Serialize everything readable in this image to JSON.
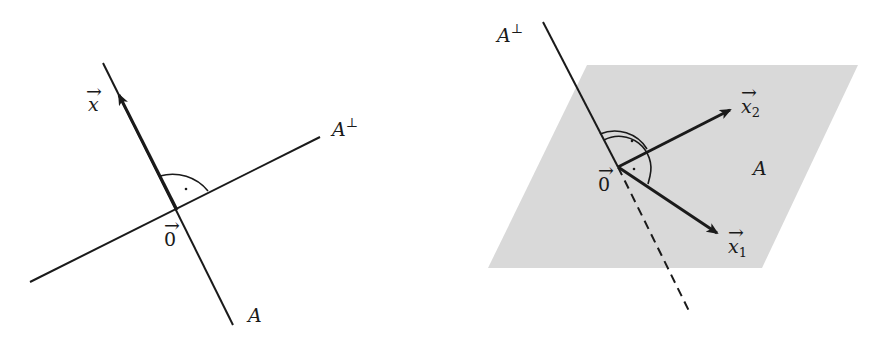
{
  "left_diagram": {
    "labels": {
      "vector_x": "x",
      "a_perp": "A",
      "a_perp_sup": "⊥",
      "a": "A",
      "origin": "0"
    },
    "description": "Line A and its orthogonal complement A-perp (a line) meeting at origin with right angle; vector x along A"
  },
  "right_diagram": {
    "labels": {
      "a_perp": "A",
      "a_perp_sup": "⊥",
      "plane_a": "A",
      "origin": "0",
      "x1": "x",
      "x1_sub": "1",
      "x2": "x",
      "x2_sub": "2"
    },
    "description": "Plane A spanned by x1, x2 with orthogonal line A-perp through origin; dashed part behind plane"
  },
  "colors": {
    "ink": "#1a1a1a",
    "plane_fill": "#d9d9d9",
    "background": "#ffffff"
  }
}
